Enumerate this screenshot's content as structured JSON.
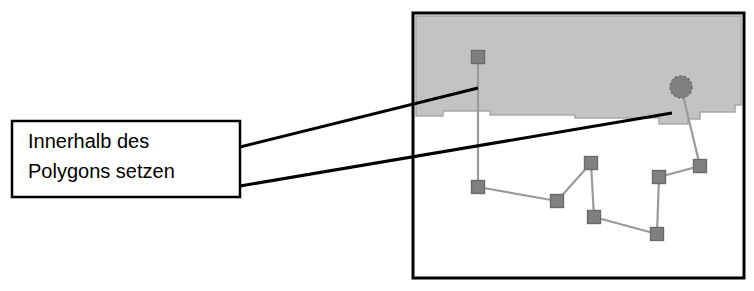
{
  "figure": {
    "type": "annotated-map-diagram",
    "background_color": "#ffffff"
  },
  "callout": {
    "name": "polygon-callout-box",
    "line1": "Innerhalb des",
    "line2": "Polygons setzen",
    "border_color": "#000000",
    "fill_color": "#ffffff",
    "box": {
      "x": 12,
      "y": 121,
      "width": 228,
      "height": 76
    },
    "leaders": [
      {
        "name": "leader-line-upper",
        "x1": 240,
        "y1": 147,
        "x2": 478,
        "y2": 88
      },
      {
        "name": "leader-line-lower",
        "x1": 240,
        "y1": 186,
        "x2": 672,
        "y2": 113
      }
    ]
  },
  "map_panel": {
    "name": "map-frame",
    "frame": {
      "x": 413,
      "y": 13,
      "width": 331,
      "height": 265
    },
    "frame_color": "#000000",
    "frame_width": 3,
    "fill_color": "#ffffff",
    "polygon": {
      "name": "shaded-polygon-region",
      "fill_color": "#c3c3c3",
      "stroke_color": "#a8a8a8",
      "points": "416,16 741,16 741,105 735,105 735,112 700,112 700,119 688,119 688,124 659,124 659,118 575,118 575,115 490,115 490,111 443,111 443,116 416,116"
    },
    "node_color": "#808080",
    "node_stroke": "#6b6b6b",
    "edge_color": "#9a9a9a",
    "node_size": 13,
    "nodes": [
      {
        "id": "n-top-inside",
        "name": "node-top-inside-polygon",
        "shape": "square",
        "x": 478,
        "y": 57
      },
      {
        "id": "n-circle",
        "name": "node-circle-inside-polygon",
        "shape": "circle",
        "x": 681,
        "y": 87,
        "radius": 11
      },
      {
        "id": "n-left",
        "name": "node-left",
        "shape": "square",
        "x": 478,
        "y": 187
      },
      {
        "id": "n-left-mid",
        "name": "node-left-mid",
        "shape": "square",
        "x": 557,
        "y": 201
      },
      {
        "id": "n-mid-top",
        "name": "node-mid-top",
        "shape": "square",
        "x": 591,
        "y": 163
      },
      {
        "id": "n-mid-low",
        "name": "node-mid-low",
        "shape": "square",
        "x": 594,
        "y": 217
      },
      {
        "id": "n-right-mid",
        "name": "node-right-mid",
        "shape": "square",
        "x": 659,
        "y": 177
      },
      {
        "id": "n-right-top",
        "name": "node-right-top",
        "shape": "square",
        "x": 700,
        "y": 166
      },
      {
        "id": "n-right-low",
        "name": "node-right-low",
        "shape": "square",
        "x": 657,
        "y": 234
      }
    ],
    "edges": [
      {
        "name": "edge-top-stem",
        "from": "n-top-inside",
        "to": "n-left"
      },
      {
        "name": "edge-left-leftmid",
        "from": "n-left",
        "to": "n-left-mid"
      },
      {
        "name": "edge-leftmid-midtop",
        "from": "n-left-mid",
        "to": "n-mid-top"
      },
      {
        "name": "edge-midtop-midlow",
        "from": "n-mid-top",
        "to": "n-mid-low"
      },
      {
        "name": "edge-midlow-rightlow",
        "from": "n-mid-low",
        "to": "n-right-low"
      },
      {
        "name": "edge-rightlow-rightmid",
        "from": "n-right-low",
        "to": "n-right-mid"
      },
      {
        "name": "edge-rightmid-righttop",
        "from": "n-right-mid",
        "to": "n-right-top"
      },
      {
        "name": "edge-righttop-circle",
        "from": "n-right-top",
        "to": "n-circle"
      }
    ]
  }
}
